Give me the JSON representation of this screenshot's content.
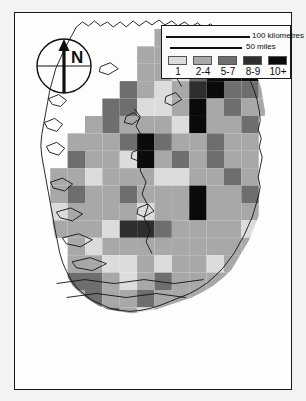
{
  "figure": {
    "kind": "choropleth-grid-map",
    "region": "Ireland",
    "frame_border_color": "#1a1a1a",
    "background_color": "#f3f3f3",
    "coast_line_color": "#111111"
  },
  "compass": {
    "name": "north-arrow",
    "label": "N"
  },
  "scale_bar": {
    "primary_label": "100 kilometres",
    "secondary_label": "50 miles"
  },
  "legend": {
    "classes": [
      {
        "label": "1",
        "color": "#dcdcdc"
      },
      {
        "label": "2-4",
        "color": "#a8a8a8"
      },
      {
        "label": "5-7",
        "color": "#6e6e6e"
      },
      {
        "label": "8-9",
        "color": "#2e2e2e"
      },
      {
        "label": "10+",
        "color": "#0a0a0a"
      }
    ]
  },
  "chart_data": {
    "type": "heatmap",
    "title": "",
    "xlabel": "",
    "ylabel": "",
    "grid": true,
    "legend_position": "bottom-right",
    "cell_size_px": 17.5,
    "origin_px": [
      18,
      16
    ],
    "class_breaks": [
      "1",
      "2-4",
      "5-7",
      "8-9",
      "10+"
    ],
    "class_colors": [
      "#dcdcdc",
      "#a8a8a8",
      "#6e6e6e",
      "#2e2e2e",
      "#0a0a0a"
    ],
    "ncols": 15,
    "nrows": 21,
    "note": "Value 0 = no data / blank (white). Values 1-5 map to class_breaks index+1.",
    "values": [
      [
        0,
        0,
        0,
        0,
        0,
        0,
        0,
        2,
        2,
        3,
        0,
        5,
        5,
        0,
        0
      ],
      [
        0,
        0,
        0,
        0,
        0,
        0,
        2,
        2,
        1,
        3,
        5,
        5,
        5,
        3,
        0
      ],
      [
        0,
        0,
        0,
        0,
        0,
        0,
        2,
        2,
        1,
        3,
        5,
        5,
        5,
        3,
        0
      ],
      [
        0,
        0,
        0,
        0,
        0,
        3,
        2,
        1,
        2,
        4,
        5,
        3,
        3,
        2,
        0
      ],
      [
        0,
        0,
        0,
        0,
        3,
        3,
        1,
        1,
        2,
        5,
        2,
        3,
        2,
        2,
        0
      ],
      [
        0,
        0,
        0,
        2,
        3,
        2,
        2,
        2,
        1,
        5,
        2,
        2,
        3,
        0,
        0
      ],
      [
        0,
        0,
        2,
        2,
        2,
        3,
        5,
        3,
        2,
        2,
        3,
        2,
        2,
        0,
        0
      ],
      [
        0,
        0,
        3,
        2,
        2,
        1,
        5,
        2,
        3,
        2,
        3,
        2,
        2,
        0,
        0
      ],
      [
        0,
        2,
        2,
        1,
        2,
        2,
        2,
        1,
        1,
        2,
        2,
        3,
        2,
        0,
        0
      ],
      [
        0,
        2,
        3,
        2,
        2,
        3,
        2,
        2,
        2,
        5,
        2,
        2,
        3,
        0,
        0
      ],
      [
        0,
        1,
        2,
        2,
        2,
        2,
        1,
        2,
        2,
        5,
        2,
        2,
        2,
        0,
        0
      ],
      [
        0,
        2,
        2,
        2,
        1,
        4,
        4,
        3,
        2,
        2,
        2,
        2,
        1,
        0,
        0
      ],
      [
        0,
        0,
        2,
        1,
        2,
        2,
        2,
        2,
        2,
        2,
        2,
        2,
        2,
        0,
        0
      ],
      [
        0,
        0,
        2,
        2,
        1,
        1,
        2,
        1,
        2,
        2,
        1,
        2,
        2,
        0,
        0
      ],
      [
        0,
        0,
        3,
        3,
        2,
        1,
        2,
        3,
        2,
        2,
        2,
        2,
        0,
        0,
        0
      ],
      [
        0,
        0,
        2,
        3,
        2,
        2,
        3,
        2,
        2,
        2,
        3,
        2,
        0,
        0,
        0
      ],
      [
        0,
        2,
        2,
        1,
        3,
        2,
        1,
        2,
        2,
        3,
        2,
        0,
        0,
        0,
        0
      ],
      [
        0,
        2,
        1,
        2,
        2,
        1,
        2,
        2,
        1,
        2,
        2,
        0,
        0,
        0,
        0
      ],
      [
        0,
        2,
        2,
        2,
        1,
        2,
        2,
        1,
        2,
        2,
        0,
        0,
        0,
        0,
        0
      ],
      [
        0,
        0,
        2,
        2,
        2,
        3,
        2,
        2,
        2,
        0,
        0,
        0,
        0,
        0,
        0
      ],
      [
        0,
        0,
        0,
        2,
        2,
        2,
        2,
        2,
        0,
        0,
        0,
        0,
        0,
        0,
        0
      ]
    ]
  }
}
